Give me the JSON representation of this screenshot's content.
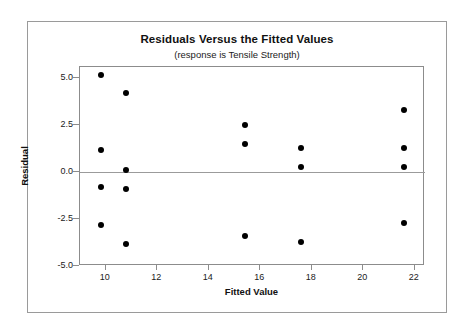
{
  "figure": {
    "title": "Residuals Versus the Fitted Values",
    "subtitle": "(response is Tensile Strength)",
    "x_axis_title": "Fitted Value",
    "y_axis_title": "Residual"
  },
  "chart_data": {
    "type": "scatter",
    "title": "Residuals Versus the Fitted Values",
    "subtitle": "(response is Tensile Strength)",
    "xlabel": "Fitted Value",
    "ylabel": "Residual",
    "xlim": [
      9.0,
      22.4
    ],
    "ylim": [
      -5.0,
      5.6
    ],
    "xticks": [
      10,
      12,
      14,
      16,
      18,
      20,
      22
    ],
    "xtick_labels": [
      "10",
      "12",
      "14",
      "16",
      "18",
      "20",
      "22"
    ],
    "yticks": [
      5.0,
      2.5,
      0.0,
      -2.5,
      -5.0
    ],
    "ytick_labels": [
      "5.0",
      "2.5",
      "0.0",
      "-2.5",
      "-5.0"
    ],
    "grid": false,
    "legend": "none",
    "reference_lines": [
      {
        "axis": "y",
        "value": 0.0,
        "color": "#9b9b9b"
      }
    ],
    "marker": {
      "shape": "circle",
      "color": "#000000",
      "size": 6
    },
    "points": [
      {
        "x": 9.8,
        "y": 5.2
      },
      {
        "x": 9.8,
        "y": 1.2
      },
      {
        "x": 9.8,
        "y": -0.8
      },
      {
        "x": 9.8,
        "y": -2.8
      },
      {
        "x": 10.8,
        "y": 4.2
      },
      {
        "x": 10.8,
        "y": 0.1
      },
      {
        "x": 10.8,
        "y": -0.9
      },
      {
        "x": 10.8,
        "y": -3.8
      },
      {
        "x": 15.4,
        "y": 2.5
      },
      {
        "x": 15.4,
        "y": 1.5
      },
      {
        "x": 15.4,
        "y": -3.4
      },
      {
        "x": 17.6,
        "y": 1.3
      },
      {
        "x": 17.6,
        "y": 0.3
      },
      {
        "x": 17.6,
        "y": -3.7
      },
      {
        "x": 21.6,
        "y": 3.3
      },
      {
        "x": 21.6,
        "y": 1.3
      },
      {
        "x": 21.6,
        "y": 0.3
      },
      {
        "x": 21.6,
        "y": -2.7
      }
    ]
  }
}
